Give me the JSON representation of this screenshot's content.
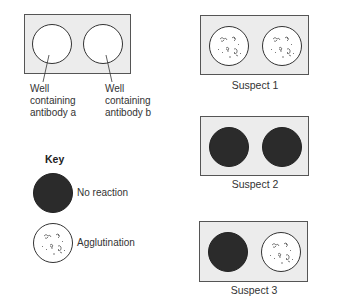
{
  "reference_plate": {
    "wells": [
      {
        "label_lines": [
          "Well",
          "containing",
          "antibody a"
        ],
        "state": "empty"
      },
      {
        "label_lines": [
          "Well",
          "containing",
          "antibody b"
        ],
        "state": "empty"
      }
    ]
  },
  "suspects": [
    {
      "label": "Suspect 1",
      "wells": [
        "agglutination",
        "agglutination"
      ]
    },
    {
      "label": "Suspect 2",
      "wells": [
        "no-reaction",
        "no-reaction"
      ]
    },
    {
      "label": "Suspect 3",
      "wells": [
        "no-reaction",
        "agglutination"
      ]
    }
  ],
  "key": {
    "title": "Key",
    "items": [
      {
        "symbol": "dark-circle",
        "label": "No reaction"
      },
      {
        "symbol": "speckled-circle",
        "label": "Agglutination"
      }
    ]
  },
  "colors": {
    "plate_fill": "#ececec",
    "no_reaction_fill": "#2b2b2b",
    "outline": "#333333"
  }
}
